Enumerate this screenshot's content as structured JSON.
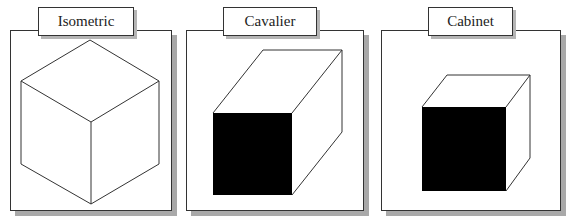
{
  "figure": {
    "panels": [
      {
        "label": "Isometric",
        "projection": "isometric"
      },
      {
        "label": "Cavalier",
        "projection": "cavalier"
      },
      {
        "label": "Cabinet",
        "projection": "cabinet"
      }
    ],
    "colors": {
      "line": "#333333",
      "shadow": "#a9a9a9",
      "background": "#ffffff"
    }
  }
}
